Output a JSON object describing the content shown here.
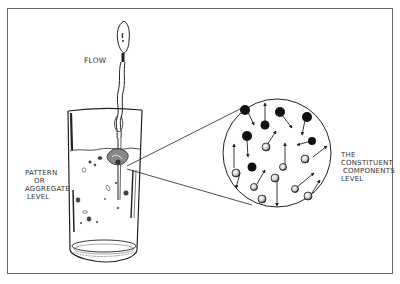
{
  "diagram": {
    "labels": {
      "flow": "FLOW",
      "pattern_lines": [
        "PATTERN",
        "OR",
        "AGGREGATE",
        "LEVEL"
      ],
      "constituent_lines": [
        "THE",
        "CONSTITUENT",
        "COMPONENTS",
        "LEVEL"
      ]
    },
    "elements": {
      "spoon": "spoon pouring stream",
      "glass": "glass of water with dissolving aggregate",
      "magnifier": "magnified circle of moving particles"
    },
    "colors": {
      "ink": "#222222",
      "frame": "#6a6a6a",
      "background": "#ffffff"
    }
  }
}
